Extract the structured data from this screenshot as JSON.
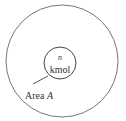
{
  "diagram": {
    "outer_circle": {
      "cx": 62,
      "cy": 61,
      "r": 56
    },
    "inner_circle": {
      "cx": 60,
      "cy": 63,
      "r": 16
    },
    "inner_label_var": "n",
    "inner_label_unit": "kmol",
    "area_label_prefix": "Area ",
    "area_label_var": "A",
    "stroke_color": "#555555"
  }
}
